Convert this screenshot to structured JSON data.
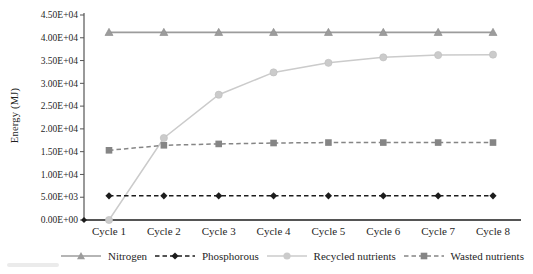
{
  "chart_data": {
    "type": "line",
    "title": "",
    "xlabel": "",
    "ylabel": "Energy (MJ)",
    "ylim": [
      0,
      45000
    ],
    "grid": false,
    "legend_position": "bottom",
    "y_tick_labels": [
      "0.00E+00",
      "5.00E+03",
      "1.00E+04",
      "1.50E+04",
      "2.00E+04",
      "2.50E+04",
      "3.00E+04",
      "3.50E+04",
      "4.00E+04",
      "4.50E+04"
    ],
    "categories": [
      "Cycle 1",
      "Cycle 2",
      "Cycle 3",
      "Cycle 4",
      "Cycle 5",
      "Cycle 6",
      "Cycle 7",
      "Cycle 8"
    ],
    "series": [
      {
        "name": "Nitrogen",
        "color": "#9c9c9c",
        "marker": "triangle",
        "line_style": "solid",
        "values": [
          41200,
          41200,
          41200,
          41200,
          41200,
          41200,
          41200,
          41200
        ]
      },
      {
        "name": "Phosphorous",
        "color": "#1c1c1c",
        "marker": "diamond",
        "line_style": "dashed",
        "values": [
          5300,
          5300,
          5300,
          5300,
          5300,
          5300,
          5300,
          5300
        ]
      },
      {
        "name": "Recycled nutrients",
        "color": "#cbcbcb",
        "marker": "circle",
        "line_style": "solid",
        "values": [
          0,
          18000,
          27500,
          32400,
          34500,
          35700,
          36200,
          36300
        ]
      },
      {
        "name": "Wasted nutrients",
        "color": "#858585",
        "marker": "square",
        "line_style": "dashed",
        "values": [
          15300,
          16400,
          16700,
          16900,
          17000,
          17000,
          17000,
          17000
        ]
      }
    ],
    "axis_color": "#555555",
    "tick_label_color": "#1f1f1f"
  }
}
